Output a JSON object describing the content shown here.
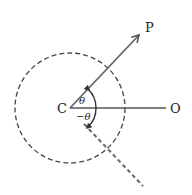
{
  "diagram": {
    "type": "polar-angle-diagram",
    "points": {
      "center": "C",
      "reference": "O",
      "rotated": "P"
    },
    "angles": {
      "positive": "θ",
      "negative": "−θ"
    },
    "elements": [
      {
        "kind": "dashed-circle",
        "centered_at": "C"
      },
      {
        "kind": "solid-line",
        "from": "C",
        "to": "O"
      },
      {
        "kind": "arrow",
        "from": "C",
        "to": "P",
        "angle_label": "θ"
      },
      {
        "kind": "dashed-line",
        "from": "C",
        "direction": "mirror of P across CO",
        "angle_label": "−θ"
      }
    ],
    "colors": {
      "stroke": "#555555",
      "text": "#222222"
    }
  }
}
